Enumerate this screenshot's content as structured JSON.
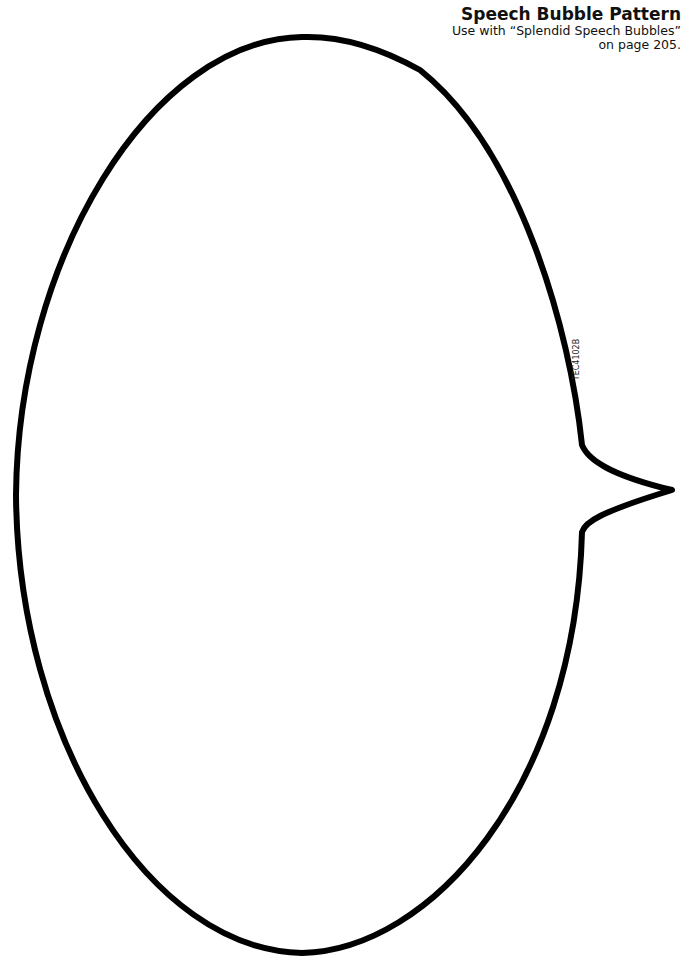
{
  "header": {
    "title": "Speech Bubble Pattern",
    "line1": "Use with “Splendid Speech Bubbles”",
    "line2": "on page 205."
  },
  "code_label": "TEC4102B",
  "colors": {
    "stroke": "#000000",
    "background": "#ffffff"
  }
}
